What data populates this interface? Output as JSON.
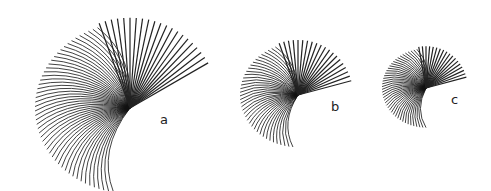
{
  "figure": {
    "panels": [
      {
        "label": "a",
        "cx": 130,
        "cy": 108,
        "r": 95,
        "start": 100,
        "end": 250,
        "upper_start": 250,
        "upper_end": 330
      },
      {
        "label": "b",
        "cx": 298,
        "cy": 95,
        "r": 58,
        "start": 95,
        "end": 250,
        "upper_start": 250,
        "upper_end": 345
      },
      {
        "label": "c",
        "cx": 426,
        "cy": 88,
        "r": 44,
        "start": 90,
        "end": 260,
        "upper_start": 260,
        "upper_end": 345
      }
    ]
  }
}
